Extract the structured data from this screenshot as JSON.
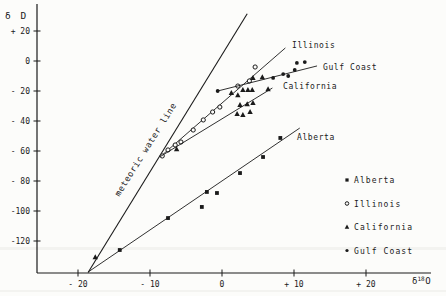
{
  "figure": {
    "bg": "#fcfcfa",
    "ink": "#1a1a1a"
  },
  "axes": {
    "y_label": "δ D",
    "x_label": {
      "prefix": "δ",
      "sup": "18",
      "suffix": "O"
    },
    "y_ticks": [
      {
        "label": "+ 20",
        "value": 20
      },
      {
        "label": "0",
        "value": 0
      },
      {
        "label": "- 20",
        "value": -20
      },
      {
        "label": "- 40",
        "value": -40
      },
      {
        "label": "- 60",
        "value": -60
      },
      {
        "label": "- 80",
        "value": -80
      },
      {
        "label": "-100",
        "value": -100
      },
      {
        "label": "-120",
        "value": -120
      }
    ],
    "x_ticks": [
      {
        "label": "- 20",
        "value": -20
      },
      {
        "label": "- 10",
        "value": -10
      },
      {
        "label": "0",
        "value": 0
      },
      {
        "label": "+ 10",
        "value": 10
      },
      {
        "label": "+ 20",
        "value": 20
      }
    ]
  },
  "chart_data": {
    "type": "scatter",
    "title": "",
    "xlabel": "δ18O",
    "ylabel": "δD",
    "xlim": [
      -25,
      28
    ],
    "ylim": [
      -141,
      38
    ],
    "grid": false,
    "legend_position": "lower right",
    "reference_line": {
      "label": "meteoric water line",
      "x": [
        -18.6,
        3.5
      ],
      "y": [
        -141,
        31.5
      ]
    },
    "series": [
      {
        "name": "Alberta",
        "marker": "filled-square",
        "line": {
          "x": [
            -18.6,
            10.8
          ],
          "y": [
            -140.7,
            -44.7
          ]
        },
        "points": [
          [
            -14.2,
            -126
          ],
          [
            -7.5,
            -104.7
          ],
          [
            -2.8,
            -97.3
          ],
          [
            -2.1,
            -87.3
          ],
          [
            -0.7,
            -88
          ],
          [
            2.5,
            -74.7
          ],
          [
            5.7,
            -64
          ],
          [
            8.1,
            -51.3
          ]
        ]
      },
      {
        "name": "Illinois",
        "marker": "open-circle",
        "line": {
          "x": [
            -8.5,
            8.8
          ],
          "y": [
            -63.5,
            8.7
          ]
        },
        "points": [
          [
            -8.3,
            -63.3
          ],
          [
            -7.5,
            -59.3
          ],
          [
            -6.5,
            -56
          ],
          [
            -5.7,
            -54
          ],
          [
            -4,
            -46
          ],
          [
            -2.6,
            -39.3
          ],
          [
            -1.3,
            -34
          ],
          [
            -0.3,
            -30.7
          ],
          [
            2.2,
            -16.7
          ],
          [
            3.8,
            -13.3
          ],
          [
            4.6,
            -4
          ]
        ]
      },
      {
        "name": "California",
        "marker": "filled-triangle",
        "line": {
          "x": [
            -8.5,
            7.0
          ],
          "y": [
            -63.5,
            -18
          ]
        },
        "points": [
          [
            -17.6,
            -130.7
          ],
          [
            -6.3,
            -58.7
          ],
          [
            1.3,
            -21.3
          ],
          [
            2.2,
            -22.7
          ],
          [
            2.9,
            -19.3
          ],
          [
            3.6,
            -19.3
          ],
          [
            4.2,
            -19.3
          ],
          [
            2.5,
            -29.3
          ],
          [
            3.5,
            -28.7
          ],
          [
            4.3,
            -28
          ],
          [
            2.1,
            -35.3
          ],
          [
            2.9,
            -36
          ],
          [
            3.9,
            -34
          ],
          [
            6.4,
            -18.7
          ],
          [
            4.3,
            -11.3
          ],
          [
            5.6,
            -10.7
          ]
        ]
      },
      {
        "name": "Gulf Coast",
        "marker": "filled-circle",
        "line": {
          "x": [
            -0.6,
            13.2
          ],
          "y": [
            -20,
            -3.3
          ]
        },
        "points": [
          [
            -0.6,
            -20
          ],
          [
            7.1,
            -11.3
          ],
          [
            8.5,
            -8.7
          ],
          [
            9.2,
            -10
          ],
          [
            10.1,
            -6
          ],
          [
            10.4,
            -1.3
          ],
          [
            11.5,
            -0.7
          ]
        ]
      }
    ]
  },
  "legend": {
    "items": [
      {
        "marker": "filled-square",
        "label": "Alberta"
      },
      {
        "marker": "open-circle",
        "label": "Illinois"
      },
      {
        "marker": "filled-triangle",
        "label": "California"
      },
      {
        "marker": "filled-circle",
        "label": "Gulf Coast"
      }
    ]
  }
}
